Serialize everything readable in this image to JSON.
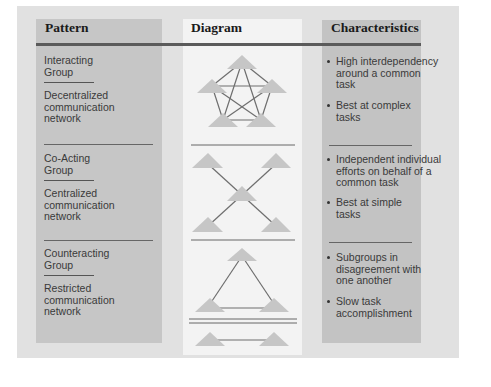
{
  "headers": {
    "pattern": "Pattern",
    "diagram": "Diagram",
    "characteristics": "Characteristics"
  },
  "rows": [
    {
      "group": [
        "Interacting",
        "Group"
      ],
      "network": [
        "Decentralized",
        "communication",
        "network"
      ],
      "diagram_type": "pentagon-fully-connected",
      "characteristics": [
        [
          "High interdependency",
          "around a common",
          "task"
        ],
        [
          "Best at complex",
          "tasks"
        ]
      ]
    },
    {
      "group": [
        "Co-Acting",
        "Group"
      ],
      "network": [
        "Centralized",
        "communication",
        "network"
      ],
      "diagram_type": "x-hub-centralized",
      "characteristics": [
        [
          "Independent individual",
          "efforts on behalf of a",
          "common task"
        ],
        [
          "Best at simple",
          "tasks"
        ]
      ]
    },
    {
      "group": [
        "Counteracting",
        "Group"
      ],
      "network": [
        "Restricted",
        "communication",
        "network"
      ],
      "diagram_type": "triangle-plus-split-pair",
      "characteristics": [
        [
          "Subgroups in",
          "disagreement with",
          "one another"
        ],
        [
          "Slow task",
          "accomplishment"
        ]
      ]
    }
  ],
  "colors": {
    "outer_bg": "#e1e1e1",
    "left_col": "#c6c6c6",
    "mid_col": "#f3f3f3",
    "right_col": "#c3c3c3",
    "node_fill": "#c4c4c4",
    "line": "#6a6a6a"
  }
}
